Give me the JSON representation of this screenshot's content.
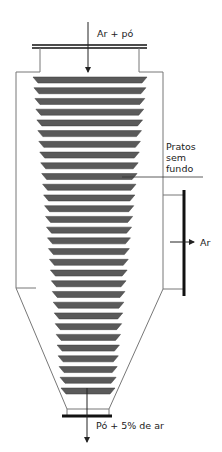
{
  "diagram": {
    "labels": {
      "inlet": "Ar + pó",
      "plates_line1": "Pratos",
      "plates_line2": "sem",
      "plates_line3": "fundo",
      "air_outlet": "Ar",
      "dust_outlet": "Pó + 5% de ar"
    },
    "plate_count": 30,
    "colors": {
      "plate_fill": "#5a5a5a",
      "wall": "#777777",
      "outline_thick": "#111111",
      "text": "#222222"
    }
  }
}
